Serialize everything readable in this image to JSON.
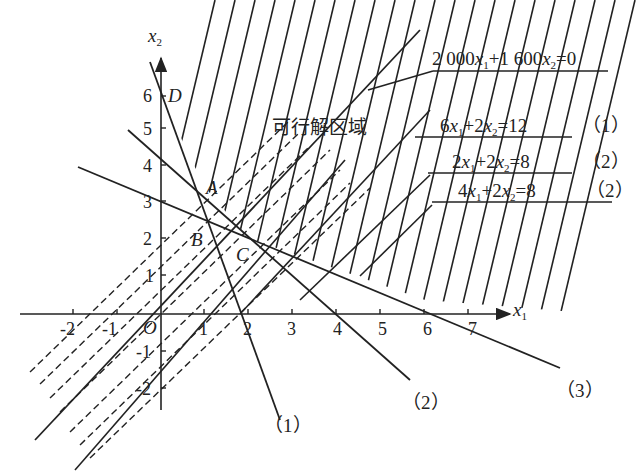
{
  "diagram": {
    "type": "linear-programming-graphical-solution",
    "axes": {
      "x_label": "x",
      "x_sub": "1",
      "y_label": "x",
      "y_sub": "2",
      "origin_label": "O",
      "x_ticks": [
        "-2",
        "-1",
        "1",
        "2",
        "3",
        "4",
        "5",
        "6",
        "7"
      ],
      "y_ticks": [
        "6",
        "5",
        "4",
        "3",
        "2",
        "1",
        "-1",
        "-2"
      ]
    },
    "region_label": "可行解区域",
    "points": {
      "A": "A",
      "B": "B",
      "C": "C",
      "D": "D"
    },
    "equations": [
      {
        "text_a": "2 000",
        "var1": "x",
        "sub1": "1",
        "mid": "+1 600",
        "var2": "x",
        "sub2": "2",
        "rhs": "=0",
        "tag": ""
      },
      {
        "text_a": "6",
        "var1": "x",
        "sub1": "1",
        "mid": "+2",
        "var2": "x",
        "sub2": "2",
        "rhs": "=12",
        "tag": "（1）"
      },
      {
        "text_a": "2",
        "var1": "x",
        "sub1": "1",
        "mid": "+2",
        "var2": "x",
        "sub2": "2",
        "rhs": "=8",
        "tag": "（2）"
      },
      {
        "text_a": "4",
        "var1": "x",
        "sub1": "1",
        "mid": "+2",
        "var2": "x",
        "sub2": "2",
        "rhs": "=8",
        "tag": "（2）"
      }
    ],
    "line_tags": [
      "（1）",
      "（2）",
      "（3）"
    ],
    "colors": {
      "ink": "#222222",
      "background": "#ffffff"
    }
  }
}
